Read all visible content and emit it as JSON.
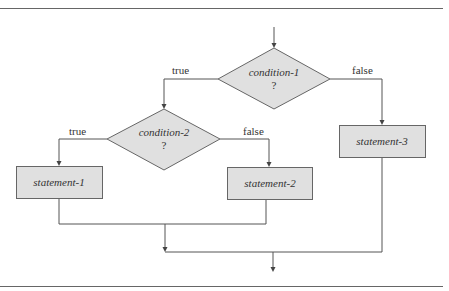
{
  "diagram": {
    "type": "flowchart",
    "colors": {
      "node_fill": "#e0e0e0",
      "line": "#555555",
      "rule": "#666666",
      "text": "#333333"
    },
    "nodes": [
      {
        "id": "condition-1",
        "shape": "diamond",
        "label": "condition-1",
        "sub": "?"
      },
      {
        "id": "condition-2",
        "shape": "diamond",
        "label": "condition-2",
        "sub": "?"
      },
      {
        "id": "statement-1",
        "shape": "rect",
        "label": "statement-1"
      },
      {
        "id": "statement-2",
        "shape": "rect",
        "label": "statement-2"
      },
      {
        "id": "statement-3",
        "shape": "rect",
        "label": "statement-3"
      }
    ],
    "edges": [
      {
        "from": "condition-1",
        "to": "condition-2",
        "label": "true"
      },
      {
        "from": "condition-1",
        "to": "statement-3",
        "label": "false"
      },
      {
        "from": "condition-2",
        "to": "statement-1",
        "label": "true"
      },
      {
        "from": "condition-2",
        "to": "statement-2",
        "label": "false"
      }
    ]
  }
}
